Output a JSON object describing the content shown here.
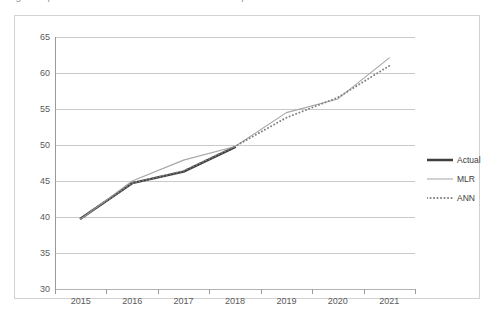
{
  "caption": {
    "text": "Fig. Comparison of actual values with MLR and ANN predicted values"
  },
  "colors": {
    "actual": "#3f3f3f",
    "mlr": "#a6a6a6",
    "ann": "#7f7f7f",
    "gridline": "#c9c9c9",
    "axis": "#9a9a9a",
    "frame": "#d2d2d2",
    "tick_text": "#5a5a5a"
  },
  "chart_data": {
    "type": "line",
    "title": "",
    "xlabel": "",
    "ylabel": "",
    "categories": [
      "2015",
      "2016",
      "2017",
      "2018",
      "2019",
      "2020",
      "2021"
    ],
    "ylim": [
      30,
      65
    ],
    "yticks": [
      30,
      35,
      40,
      45,
      50,
      55,
      60,
      65
    ],
    "grid": true,
    "legend_position": "right",
    "series": [
      {
        "name": "Actual",
        "style": "solid-thick",
        "color": "#3f3f3f",
        "values": [
          39.8,
          44.7,
          46.3,
          49.7,
          null,
          null,
          null
        ]
      },
      {
        "name": "MLR",
        "style": "solid-thin",
        "color": "#a6a6a6",
        "values": [
          39.7,
          45.0,
          47.9,
          49.8,
          54.5,
          56.4,
          62.1
        ]
      },
      {
        "name": "ANN",
        "style": "dotted",
        "color": "#7f7f7f",
        "values": [
          39.8,
          44.7,
          46.4,
          49.8,
          53.8,
          56.6,
          61.0
        ]
      }
    ]
  },
  "legend": {
    "items": [
      {
        "label": "Actual"
      },
      {
        "label": "MLR"
      },
      {
        "label": "ANN"
      }
    ]
  }
}
